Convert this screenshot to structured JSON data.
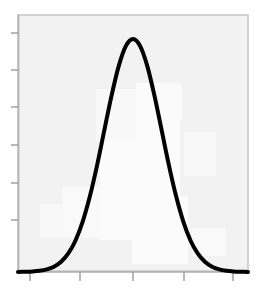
{
  "figure": {
    "width": 263,
    "height": 293,
    "page_background": "#ffffff",
    "plot_background": "#f2f2f2",
    "frame_color": "#c8c8c8",
    "curve_color": "#000000",
    "tick_color": "#9a9a9a",
    "title": "",
    "xlabel": "",
    "ylabel": ""
  },
  "plot_area": {
    "left": 18,
    "top": 15,
    "right": 248,
    "bottom": 272
  },
  "axes": {
    "x_tick_pixels": [
      30,
      80,
      133,
      184,
      233
    ],
    "y_tick_pixels": [
      33,
      70,
      107,
      145,
      183,
      220
    ],
    "x_tick_labels": [
      "",
      "",
      "",
      "",
      ""
    ],
    "y_tick_labels": [
      "",
      "",
      "",
      "",
      "",
      ""
    ],
    "grid": "off",
    "legend": "none"
  },
  "chart_data": {
    "type": "line",
    "title": "",
    "xlabel": "",
    "ylabel": "",
    "grid": false,
    "legend_position": "none",
    "xlim": [
      -4,
      4
    ],
    "ylim": [
      0,
      0.44
    ],
    "series": [
      {
        "name": "normal-distribution",
        "color": "#000000",
        "line_width": 4,
        "x": [
          -4.0,
          -3.75,
          -3.5,
          -3.25,
          -3.0,
          -2.75,
          -2.5,
          -2.25,
          -2.0,
          -1.75,
          -1.5,
          -1.25,
          -1.0,
          -0.75,
          -0.5,
          -0.25,
          0.0,
          0.25,
          0.5,
          0.75,
          1.0,
          1.25,
          1.5,
          1.75,
          2.0,
          2.25,
          2.5,
          2.75,
          3.0,
          3.25,
          3.5,
          3.75,
          4.0
        ],
        "y": [
          0.0001,
          0.0004,
          0.0009,
          0.002,
          0.0044,
          0.0091,
          0.0175,
          0.0317,
          0.054,
          0.0863,
          0.1295,
          0.1826,
          0.242,
          0.3011,
          0.3521,
          0.3867,
          0.3989,
          0.3867,
          0.3521,
          0.3011,
          0.242,
          0.1826,
          0.1295,
          0.0863,
          0.054,
          0.0317,
          0.0175,
          0.0091,
          0.0044,
          0.002,
          0.0009,
          0.0004,
          0.0001
        ]
      }
    ],
    "annotations": [],
    "peak": {
      "x": 0.0,
      "y": 0.3989,
      "pixel_x": 134,
      "pixel_y": 67
    }
  }
}
